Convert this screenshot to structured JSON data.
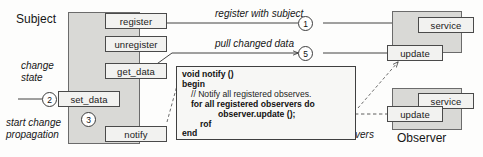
{
  "diagram": {
    "title_subject": "Subject",
    "title_observer": "Observer",
    "subject_methods": [
      {
        "id": "register",
        "label": "register"
      },
      {
        "id": "unregister",
        "label": "unregister"
      },
      {
        "id": "get_data",
        "label": "get_data"
      },
      {
        "id": "set_data",
        "label": "set_data"
      },
      {
        "id": "notify",
        "label": "notify"
      }
    ],
    "observer_methods": [
      {
        "id": "service-1",
        "label": "service"
      },
      {
        "id": "update-1",
        "label": "update"
      },
      {
        "id": "service-2",
        "label": "service"
      },
      {
        "id": "update-2",
        "label": "update"
      }
    ],
    "annotations": {
      "change_state_line1": "change",
      "change_state_line2": "state",
      "start_change_line1": "start change",
      "start_change_line2": "propagation",
      "register_with_subject": "register with subject",
      "pull_changed_data": "pull changed data",
      "notify_line1": "notify",
      "notify_line2": "observers"
    },
    "steps": [
      {
        "number": "1",
        "meaning": "register with subject"
      },
      {
        "number": "2",
        "meaning": "change state"
      },
      {
        "number": "3",
        "meaning": "start change propagation"
      },
      {
        "number": "4",
        "meaning": "notify observers"
      },
      {
        "number": "5",
        "meaning": "pull changed data"
      }
    ],
    "code": {
      "lines": [
        "void notify ()",
        "begin",
        "// Notify all registered observes.",
        "for all registered observers do",
        "observer.update ();",
        "rof",
        "end"
      ]
    },
    "colors": {
      "panel_fill": "#d9d9d6",
      "box_fill": "#f2f2f0",
      "stroke": "#4a4a4a",
      "background": "#fdfdfc"
    }
  }
}
